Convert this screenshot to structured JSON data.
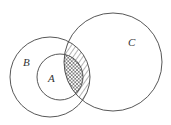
{
  "diagram": {
    "type": "venn",
    "sets": [
      {
        "name": "A",
        "label": "A",
        "cx": 60,
        "cy": 77,
        "r": 23
      },
      {
        "name": "B",
        "label": "B",
        "cx": 50,
        "cy": 77,
        "r": 40
      },
      {
        "name": "C",
        "label": "C",
        "cx": 113,
        "cy": 62,
        "r": 49
      }
    ],
    "shaded_regions": [
      {
        "region": "B ∩ C (outside A)",
        "pattern": "diagonal-hatch"
      },
      {
        "region": "A ∩ C",
        "pattern": "cross-hatch"
      }
    ],
    "stroke_color": "#444444",
    "background": "#ffffff"
  },
  "labels": {
    "a": "A",
    "b": "B",
    "c": "C"
  }
}
